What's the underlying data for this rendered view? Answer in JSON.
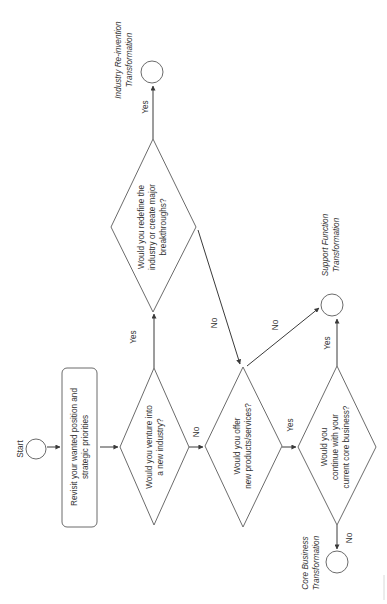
{
  "diagram": {
    "type": "flowchart",
    "orientation": "rotated-90-ccw",
    "start": {
      "label": "Start"
    },
    "process": {
      "lines": [
        "Revisit your wanted position and",
        "strategic priorities"
      ]
    },
    "decisions": [
      {
        "id": "d1",
        "lines": [
          "Would you venture into",
          "a new industry?"
        ]
      },
      {
        "id": "d2",
        "lines": [
          "Would you redefine the",
          "industry or create major",
          "breakthroughs?"
        ]
      },
      {
        "id": "d3",
        "lines": [
          "Would you offer",
          "new products/services?"
        ]
      },
      {
        "id": "d4",
        "lines": [
          "Would you",
          "continue with your",
          "current core business?"
        ]
      }
    ],
    "terminals": [
      {
        "id": "industry",
        "lines": [
          "Industry Re-invention",
          "Transformation"
        ]
      },
      {
        "id": "support",
        "lines": [
          "Support Function",
          "Transformation"
        ]
      },
      {
        "id": "core",
        "lines": [
          "Core Business",
          "Transformation"
        ]
      }
    ],
    "edges": [
      {
        "from": "start",
        "to": "process",
        "label": ""
      },
      {
        "from": "process",
        "to": "d1",
        "label": ""
      },
      {
        "from": "d1",
        "to": "d2",
        "label": "Yes"
      },
      {
        "from": "d1",
        "to": "d3",
        "label": "No"
      },
      {
        "from": "d2",
        "to": "industry",
        "label": "Yes"
      },
      {
        "from": "d2",
        "to": "d3",
        "label": "No"
      },
      {
        "from": "d3",
        "to": "support",
        "label": "No"
      },
      {
        "from": "d3",
        "to": "d4",
        "label": "Yes"
      },
      {
        "from": "d4",
        "to": "support",
        "label": "Yes"
      },
      {
        "from": "d4",
        "to": "core",
        "label": "No"
      }
    ],
    "colors": {
      "stroke": "#6b6b6b",
      "edge": "#3a3a3a",
      "text": "#333333",
      "background": "#ffffff"
    }
  }
}
